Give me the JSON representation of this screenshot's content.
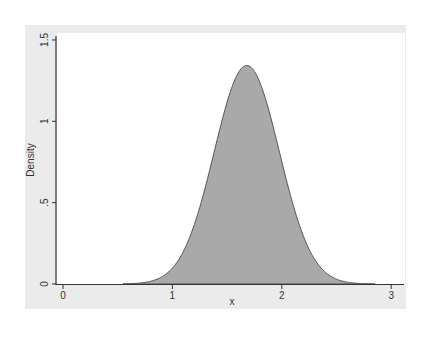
{
  "chart_data": {
    "type": "area",
    "title": "",
    "xlabel": "x",
    "ylabel": "Density",
    "xlim": [
      -0.05,
      3.12
    ],
    "ylim": [
      0,
      1.5
    ],
    "x_ticks": [
      0,
      1,
      2,
      3
    ],
    "x_tick_labels": [
      "0",
      "1",
      "2",
      "3"
    ],
    "y_ticks": [
      0,
      0.5,
      1,
      1.5
    ],
    "y_tick_labels": [
      "0",
      ".5",
      "1",
      "1.5"
    ],
    "grid": false,
    "legend": null,
    "distribution": {
      "shape": "normal",
      "mean": 1.68,
      "sd": 0.297,
      "peak_density": 1.34
    },
    "series": [
      {
        "name": "density",
        "x": [
          0.0,
          0.2,
          0.4,
          0.6,
          0.8,
          0.9,
          1.0,
          1.1,
          1.2,
          1.3,
          1.4,
          1.5,
          1.6,
          1.68,
          1.75,
          1.85,
          1.95,
          2.05,
          2.15,
          2.25,
          2.35,
          2.45,
          2.55,
          2.7,
          2.9,
          3.1
        ],
        "values": [
          0.0,
          0.0,
          0.0,
          0.0,
          0.02,
          0.04,
          0.09,
          0.2,
          0.37,
          0.59,
          0.86,
          1.11,
          1.29,
          1.34,
          1.31,
          1.14,
          0.88,
          0.61,
          0.37,
          0.2,
          0.1,
          0.04,
          0.02,
          0.0,
          0.0,
          0.0
        ]
      }
    ],
    "colors": {
      "fill": "#a9a9a9",
      "line": "#555555",
      "panel_background": "#ebebeb",
      "plot_background": "#ffffff"
    }
  }
}
